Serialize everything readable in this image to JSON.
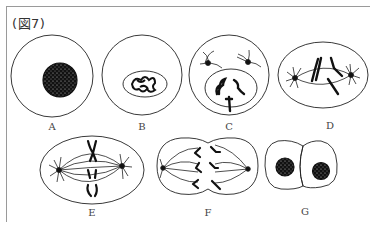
{
  "figure": {
    "title": "(図7)",
    "stroke_color": "#222222",
    "frame_color": "#9a9a9a"
  },
  "cells": [
    {
      "id": "A",
      "label": "A",
      "shape": "circle",
      "content": "dense nucleus with chromatin granules"
    },
    {
      "id": "B",
      "label": "B",
      "shape": "circle",
      "content": "oval nucleus with condensing chromosomes"
    },
    {
      "id": "C",
      "label": "C",
      "shape": "circle",
      "content": "nucleus with distinct chromosomes, two centrosomes with asters"
    },
    {
      "id": "D",
      "label": "D",
      "shape": "ellipse",
      "content": "spindle with chromosomes, poles at each end"
    },
    {
      "id": "E",
      "label": "E",
      "shape": "ellipse",
      "content": "chromosomes aligned at equator, spindle fibers"
    },
    {
      "id": "F",
      "label": "F",
      "shape": "pinched-ellipse",
      "content": "chromatids separating toward poles"
    },
    {
      "id": "G",
      "label": "G",
      "shape": "two-cells",
      "content": "two daughter cells each with a nucleus"
    }
  ]
}
